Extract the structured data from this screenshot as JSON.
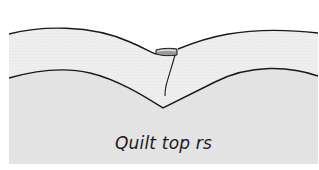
{
  "diagram": {
    "label": "Quilt top rs",
    "layers": [
      {
        "name": "top-fabric-layer",
        "fill": "#efefef"
      },
      {
        "name": "quilt-top-layer",
        "fill": "#e4e4e4"
      }
    ],
    "outline_color": "#1a1a1a",
    "fold_fill": "#9a9a9a",
    "background": "#ffffff"
  }
}
